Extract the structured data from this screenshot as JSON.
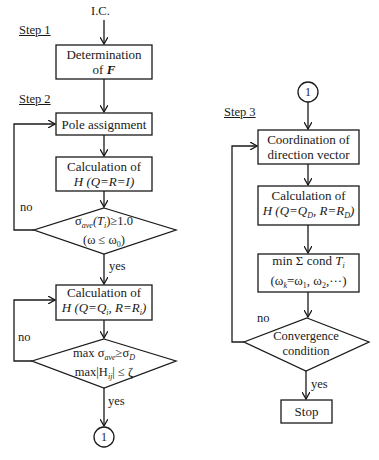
{
  "diagram": {
    "type": "flowchart",
    "start_label": "I.C.",
    "steps": [
      {
        "label": "Step 1"
      },
      {
        "label": "Step 2"
      },
      {
        "label": "Step 3"
      }
    ],
    "left_column": {
      "box_determination": {
        "line1": "Determination",
        "line2_prefix": "of ",
        "line2_var": "F"
      },
      "box_pole": {
        "text": "Pole assignment"
      },
      "box_calc1": {
        "line1": "Calculation of",
        "line2_var": "H",
        "line2_rest": " (Q=R=I)"
      },
      "diamond1": {
        "line1_sigma": "σ",
        "line1_sub": "ave",
        "line1_rest": "(T",
        "line1_sub2": "i",
        "line1_end": ")≥1.0",
        "line2": "(ω ≤ ω",
        "line2_sub": "0",
        "line2_end": ")"
      },
      "diamond1_no": "no",
      "diamond1_yes": "yes",
      "box_calc2": {
        "line1": "Calculation of",
        "line2_var": "H",
        "line2_a": " (Q=Q",
        "line2_sub_a": "i",
        "line2_b": ", R=R",
        "line2_sub_b": "i",
        "line2_end": ")"
      },
      "diamond2": {
        "line1_a": "max  σ",
        "line1_sub": "ave",
        "line1_b": "≥σ",
        "line1_sub2": "D",
        "line2_a": "max|H",
        "line2_sub": "ij",
        "line2_b": "| ≤ ζ"
      },
      "diamond2_no": "no",
      "diamond2_yes": "yes",
      "connector_out": "1"
    },
    "right_column": {
      "connector_in": "1",
      "box_coord": {
        "line1": "Coordination of",
        "line2": "direction vector"
      },
      "box_calc3": {
        "line1": "Calculation of",
        "line2_var": "H",
        "line2_a": " (Q=Q",
        "line2_sub_a": "D",
        "line2_b": ", R=R",
        "line2_sub_b": "D",
        "line2_end": ")"
      },
      "box_min": {
        "line1_a": "min Σ cond ",
        "line1_var": "T",
        "line1_sub": "i",
        "line2_a": "(ω",
        "line2_sub_a": "k",
        "line2_b": "=ω",
        "line2_sub_b": "1",
        "line2_c": ",  ω",
        "line2_sub_c": "2",
        "line2_end": ",···)"
      },
      "diamond3": {
        "line1": "Convergence",
        "line2": "condition"
      },
      "diamond3_no": "no",
      "diamond3_yes": "yes",
      "box_stop": {
        "text": "Stop"
      }
    },
    "colors": {
      "stroke": "#1a1a1a",
      "background": "#ffffff"
    }
  }
}
